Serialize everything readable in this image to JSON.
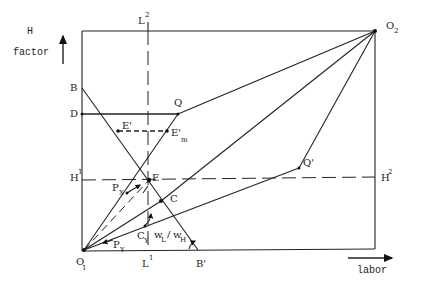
{
  "axes": {
    "vertical_label_line1": "H",
    "vertical_label_line2": "factor",
    "horizontal_label": "labor"
  },
  "origins": {
    "o1": "O",
    "o1_sub": "1",
    "o2": "O",
    "o2_sub": "2"
  },
  "points": {
    "B": "B",
    "B_prime": "B'",
    "D": "D",
    "Q": "Q",
    "Q_prime": "Q'",
    "E": "E",
    "E_prime": "E'",
    "E_prime_m": "E'",
    "E_prime_m_sub": "m",
    "C": "C"
  },
  "lines": {
    "L_upper": "L",
    "L_upper_sup": "2",
    "L_lower": "L",
    "L_lower_sup": "1",
    "H_left": "H",
    "H_left_sup": "1",
    "H_right": "H",
    "H_right_sup": "2"
  },
  "annotations": {
    "Px": "P",
    "Px_sub": "X",
    "Py": "P",
    "Py_sub": "Y",
    "Cy": "C",
    "Cy_sub": "Y",
    "wage_ratio_num": "w",
    "wage_ratio_num_sub": "L",
    "wage_ratio_slash": "/",
    "wage_ratio_den": "w",
    "wage_ratio_den_sub": "H"
  },
  "colors": {
    "ink": "#222222",
    "background": "#ffffff"
  }
}
